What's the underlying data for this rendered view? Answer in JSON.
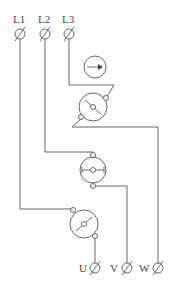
{
  "diagram": {
    "type": "wiring-schematic",
    "inputs": [
      {
        "label": "L1",
        "x": 20
      },
      {
        "label": "L2",
        "x": 45
      },
      {
        "label": "L3",
        "x": 69
      }
    ],
    "outputs": [
      {
        "label": "U",
        "x": 95
      },
      {
        "label": "V",
        "x": 127
      },
      {
        "label": "W",
        "x": 158
      }
    ],
    "components": [
      {
        "name": "rotation-direction-indicator",
        "symbol": "arrow-right-in-circle"
      },
      {
        "name": "switch-contact-1",
        "symbol": "diagonal-contact"
      },
      {
        "name": "switch-contact-2",
        "symbol": "horizontal-contact"
      },
      {
        "name": "switch-contact-3",
        "symbol": "diagonal-contact"
      }
    ],
    "colors": {
      "line": "#666666",
      "text": "#444444",
      "background": "#ffffff"
    }
  }
}
